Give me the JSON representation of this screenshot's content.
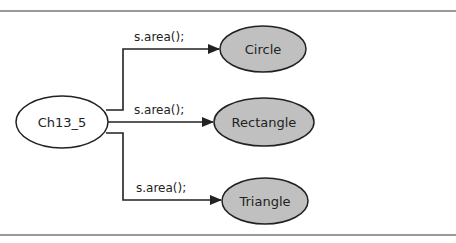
{
  "diagram": {
    "type": "flow",
    "colors": {
      "rule": "#9a9a9a",
      "stroke": "#222222",
      "source_fill": "#ffffff",
      "target_fill": "#c0c0c0"
    },
    "source": {
      "id": "ch13_5",
      "label": "Ch13_5"
    },
    "targets": [
      {
        "id": "circle",
        "label": "Circle",
        "edge_label": "s.area();"
      },
      {
        "id": "rectangle",
        "label": "Rectangle",
        "edge_label": "s.area();"
      },
      {
        "id": "triangle",
        "label": "Triangle",
        "edge_label": "s.area();"
      }
    ]
  }
}
